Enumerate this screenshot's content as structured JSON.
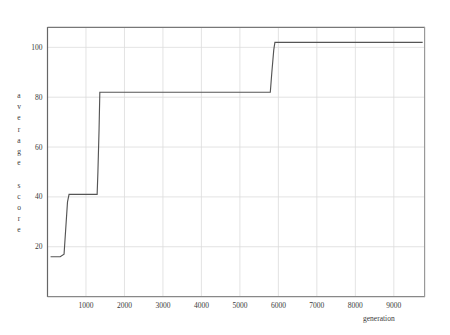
{
  "chart_data": {
    "type": "line",
    "title": "",
    "xlabel": "generation",
    "ylabel": "average score",
    "ylabel_letters": [
      "a",
      "v",
      "e",
      "r",
      "a",
      "g",
      "e",
      "",
      "s",
      "c",
      "o",
      "r",
      "e"
    ],
    "xlim": [
      0,
      9800
    ],
    "ylim": [
      0,
      108
    ],
    "grid": true,
    "legend": null,
    "xticks": [
      1000,
      2000,
      3000,
      4000,
      5000,
      6000,
      7000,
      8000,
      9000
    ],
    "xtick_labels": [
      "1000",
      "2000",
      "3000",
      "4000",
      "5000",
      "6000",
      "7000",
      "8000",
      "9000"
    ],
    "yticks": [
      20,
      40,
      60,
      80,
      100
    ],
    "ytick_labels": [
      "20",
      "40",
      "60",
      "80",
      "100"
    ],
    "line_color": "#555555",
    "grid_color": "#dcdcdc",
    "axis_color": "#666666",
    "series": [
      {
        "name": "average score",
        "x": [
          80,
          330,
          430,
          520,
          560,
          1290,
          1310,
          1340,
          1360,
          5790,
          5830,
          5880,
          5910,
          9750
        ],
        "y": [
          16,
          16,
          17,
          38,
          41,
          41,
          50,
          67,
          82,
          82,
          90,
          99,
          102,
          102
        ]
      }
    ],
    "steps": [
      {
        "generation": 80,
        "score": 16
      },
      {
        "generation": 520,
        "score": 41
      },
      {
        "generation": 1320,
        "score": 67
      },
      {
        "generation": 1360,
        "score": 82
      },
      {
        "generation": 5900,
        "score": 102
      }
    ]
  }
}
